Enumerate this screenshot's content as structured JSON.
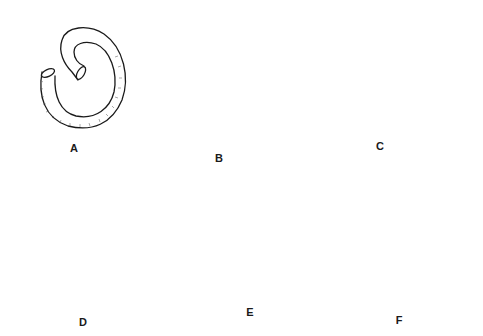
{
  "figure": {
    "type": "surgical-illustration",
    "panels": [
      {
        "id": "A",
        "label": "A",
        "x": 74,
        "y": 148,
        "depicts": "coiled bowel segment (tube)"
      },
      {
        "id": "B",
        "label": "B",
        "x": 219,
        "y": 158,
        "depicts": "bowel opened along antimesenteric border, spiral"
      },
      {
        "id": "C",
        "label": "C",
        "x": 380,
        "y": 146,
        "depicts": "V-shaped folded plate with midline suture"
      },
      {
        "id": "D",
        "label": "D",
        "x": 83,
        "y": 322,
        "depicts": "reservoir being closed, running suture with forceps"
      },
      {
        "id": "E",
        "label": "E",
        "x": 250,
        "y": 312,
        "depicts": "anterior wall folded over, suture line continued"
      },
      {
        "id": "F",
        "label": "F",
        "x": 399,
        "y": 320,
        "depicts": "completed reservoir with ureters and outlet"
      }
    ],
    "colors": {
      "ink": "#1a1a1a",
      "background": "#ffffff",
      "hatch": "#555555"
    }
  }
}
